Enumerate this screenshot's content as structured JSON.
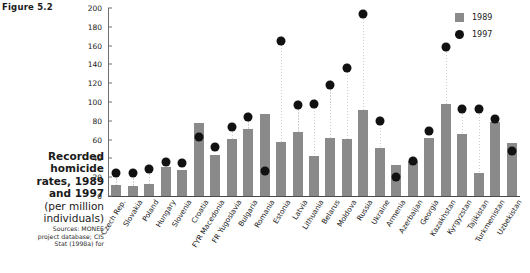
{
  "figure_number": "Figure 5.2",
  "caption": {
    "title_line1": "Recorded",
    "title_line2": "homicide",
    "title_line3": "rates, 1989",
    "title_line4": "and 1997",
    "subtitle_line1": "(per million",
    "subtitle_line2": "individuals)",
    "sources_line1": "Sources: MONEE",
    "sources_line2": "project database; CIS",
    "sources_line3": "Stat (1998a) for"
  },
  "legend": {
    "position": "top-right",
    "entries": [
      {
        "label": "1989",
        "marker": "square",
        "color": "#8a8a8a"
      },
      {
        "label": "1997",
        "marker": "circle",
        "color": "#111111"
      }
    ]
  },
  "chart_data": {
    "type": "bar",
    "title": "Recorded homicide rates, 1989 and 1997 (per million individuals)",
    "xlabel": "",
    "ylabel": "",
    "ylim": [
      0,
      200
    ],
    "yticks": [
      0,
      20,
      40,
      60,
      80,
      100,
      120,
      140,
      160,
      180,
      200
    ],
    "ytick_labels": [
      "0",
      "20",
      "40",
      "60",
      "80",
      "100",
      "120",
      "140",
      "160",
      "180",
      "200"
    ],
    "grid": false,
    "legend_position": "top-right",
    "categories": [
      "Czech Rep.",
      "Slovakia",
      "Poland",
      "Hungary",
      "Slovenia",
      "Croatia",
      "FYR Macedonia",
      "FR Yugoslavia",
      "Bulgaria",
      "Romania",
      "Estonia",
      "Latvia",
      "Lithuania",
      "Belarus",
      "Moldova",
      "Russia",
      "Ukraine",
      "Armenia",
      "Azerbaijan",
      "Georgia",
      "Kazakhstan",
      "Kyrgyzstan",
      "Tajikistan",
      "Turkmenistan",
      "Uzbekistan"
    ],
    "series": [
      {
        "name": "1989",
        "marker": "bar",
        "color": "#8a8a8a",
        "values": [
          12,
          11,
          13,
          31,
          28,
          78,
          44,
          61,
          71,
          87,
          57,
          68,
          43,
          62,
          61,
          91,
          51,
          33,
          37,
          62,
          98,
          66,
          24,
          79,
          56
        ]
      },
      {
        "name": "1997",
        "marker": "circle",
        "color": "#111111",
        "values": [
          29,
          29,
          33,
          41,
          40,
          68,
          57,
          78,
          89,
          31,
          170,
          102,
          103,
          123,
          141,
          198,
          85,
          25,
          42,
          74,
          163,
          97,
          97,
          87,
          53
        ]
      }
    ]
  }
}
